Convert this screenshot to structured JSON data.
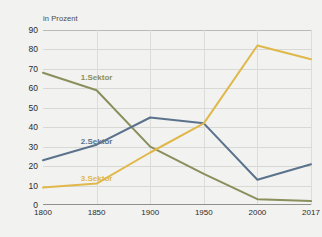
{
  "chart_data": {
    "type": "line",
    "title": "",
    "subtitle": "",
    "xlabel": "",
    "ylabel": "in Prozent",
    "axis_unit_label": "in Prozent",
    "x": [
      1800,
      1850,
      1900,
      1950,
      2000,
      2017
    ],
    "x_tick_labels": [
      "1800",
      "1850",
      "1900",
      "1950",
      "2000",
      "2017"
    ],
    "y_tick_labels": [
      "0",
      "10",
      "20",
      "30",
      "40",
      "50",
      "60",
      "70",
      "80",
      "90"
    ],
    "y_ticks": [
      0,
      10,
      20,
      30,
      40,
      50,
      60,
      70,
      80,
      90
    ],
    "ylim": [
      0,
      90
    ],
    "xlim": [
      1800,
      2017
    ],
    "grid": true,
    "legend_position": "inline-labels",
    "series": [
      {
        "name": "1.Sektor",
        "label": "1.Sektor",
        "color": "#8a8f5c",
        "values": [
          68,
          59,
          30,
          16,
          3,
          2
        ],
        "label_x": 1850,
        "label_y": 66
      },
      {
        "name": "2.Sektor",
        "label": "2.Sektor",
        "color": "#5b728c",
        "values": [
          23,
          31,
          45,
          42,
          13,
          21
        ],
        "label_x": 1850,
        "label_y": 33
      },
      {
        "name": "3.Sektor",
        "label": "3.Sektor",
        "color": "#dfb košice",
        "values": [
          9,
          11,
          27,
          42,
          82,
          75
        ],
        "label_x": 1850,
        "label_y": 14
      }
    ],
    "colors": {
      "sector1": "#8a8f5c",
      "sector2": "#5b728c",
      "sector3": "#e0b84a",
      "background": "#f2f2f0",
      "grid": "#d8d8d4",
      "axis": "#8f8f8b",
      "text": "#2b2b2b"
    }
  }
}
